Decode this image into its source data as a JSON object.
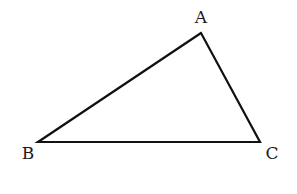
{
  "diagram": {
    "type": "triangle",
    "stroke_color": "#111111",
    "background": "#ffffff",
    "vertices": [
      {
        "label": "A",
        "x": 201,
        "y": 33,
        "label_x": 201,
        "label_y": 23
      },
      {
        "label": "B",
        "x": 38,
        "y": 142,
        "label_x": 28,
        "label_y": 159
      },
      {
        "label": "C",
        "x": 260,
        "y": 142,
        "label_x": 272,
        "label_y": 159
      }
    ]
  }
}
